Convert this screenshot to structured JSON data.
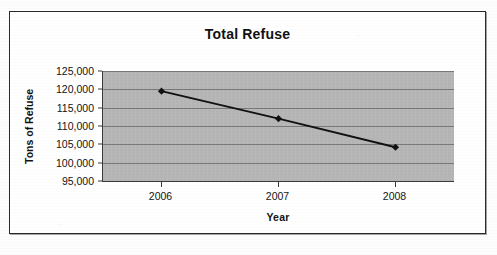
{
  "chart_data": {
    "type": "line",
    "title": "Total Refuse",
    "xlabel": "Year",
    "ylabel": "Tons of Refuse",
    "categories": [
      "2006",
      "2007",
      "2008"
    ],
    "values": [
      119500,
      112000,
      104200
    ],
    "series": [
      {
        "name": "Total Refuse",
        "values": [
          119500,
          112000,
          104200
        ]
      }
    ],
    "ylim": [
      95000,
      125000
    ],
    "ytick_step": 5000,
    "ytick_labels": [
      "125,000",
      "120,000",
      "115,000",
      "110,000",
      "105,000",
      "100,000",
      "95,000"
    ],
    "ytick_values": [
      125000,
      120000,
      115000,
      110000,
      105000,
      100000,
      95000
    ],
    "grid": true,
    "grid_axis": "y",
    "legend": false,
    "legend_position": "none",
    "marker": "diamond",
    "plot_background_color": "#b6b6b6",
    "line_color": "#111111",
    "marker_color": "#111111",
    "gridline_color": "#6d6d6d",
    "axis_color": "#3a3a3a",
    "frame_color": "#2a2a2a",
    "page_background_color": "#fdfdfd"
  }
}
